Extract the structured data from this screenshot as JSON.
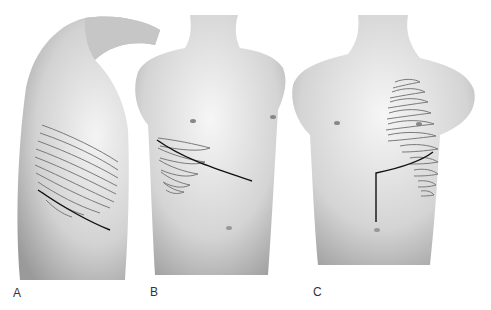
{
  "figure": {
    "panels": [
      {
        "id": "A",
        "label": "A",
        "view": "lateral torso, arm raised, rib outlines with oblique incision line"
      },
      {
        "id": "B",
        "label": "B",
        "view": "anterior torso, right lower ribs outlined with oblique incision line"
      },
      {
        "id": "C",
        "label": "C",
        "view": "anterior torso, left ribs outlined with L-shaped incision line"
      }
    ],
    "colors": {
      "skin_shade": "#b8b8b8",
      "skin_light": "#e6e6e6",
      "rib_outline": "#7a7a7a",
      "incision_line": "#111111",
      "background": "#ffffff"
    }
  }
}
